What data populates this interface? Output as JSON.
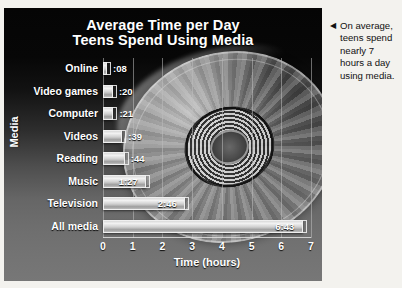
{
  "chart_data": {
    "type": "bar",
    "orientation": "horizontal",
    "title": "Average Time per Day Teens Spend Using Media",
    "title_line1": "Average Time per Day",
    "title_line2": "Teens Spend Using Media",
    "xlabel": "Time  (hours)",
    "ylabel": "Media",
    "xlim": [
      0,
      7
    ],
    "xticks": [
      "0",
      "1",
      "2",
      "3",
      "4",
      "5",
      "6",
      "7"
    ],
    "grid": true,
    "legend": "none",
    "categories": [
      "Online",
      "Video games",
      "Computer",
      "Videos",
      "Reading",
      "Music",
      "Television",
      "All media"
    ],
    "value_labels": [
      ":08",
      ":20",
      ":21",
      ":39",
      ":44",
      "1:27",
      "2:46",
      "6:43"
    ],
    "values": [
      0.133,
      0.333,
      0.35,
      0.65,
      0.733,
      1.45,
      2.767,
      6.717
    ],
    "bars": [
      {
        "category": "Online",
        "label": ":08",
        "hours": 0.133,
        "label_position": "outside"
      },
      {
        "category": "Video games",
        "label": ":20",
        "hours": 0.333,
        "label_position": "outside"
      },
      {
        "category": "Computer",
        "label": ":21",
        "hours": 0.35,
        "label_position": "outside"
      },
      {
        "category": "Videos",
        "label": ":39",
        "hours": 0.65,
        "label_position": "inside"
      },
      {
        "category": "Reading",
        "label": ":44",
        "hours": 0.733,
        "label_position": "inside"
      },
      {
        "category": "Music",
        "label": "1:27",
        "hours": 1.45,
        "label_position": "inside"
      },
      {
        "category": "Television",
        "label": "2:46",
        "hours": 2.767,
        "label_position": "inside"
      },
      {
        "category": "All media",
        "label": "6:43",
        "hours": 6.717,
        "label_position": "inside"
      }
    ],
    "colors": {
      "bar": "#d8d8d8",
      "text": "#ffffff",
      "panel_top": "#050505",
      "panel_bottom": "#777777",
      "gridline": "#bebebe"
    }
  },
  "side_note": {
    "arrow": "◀",
    "text": "On average, teens spend nearly 7 hours a day using media."
  },
  "background_art": {
    "name": "compact-disc-photo"
  }
}
